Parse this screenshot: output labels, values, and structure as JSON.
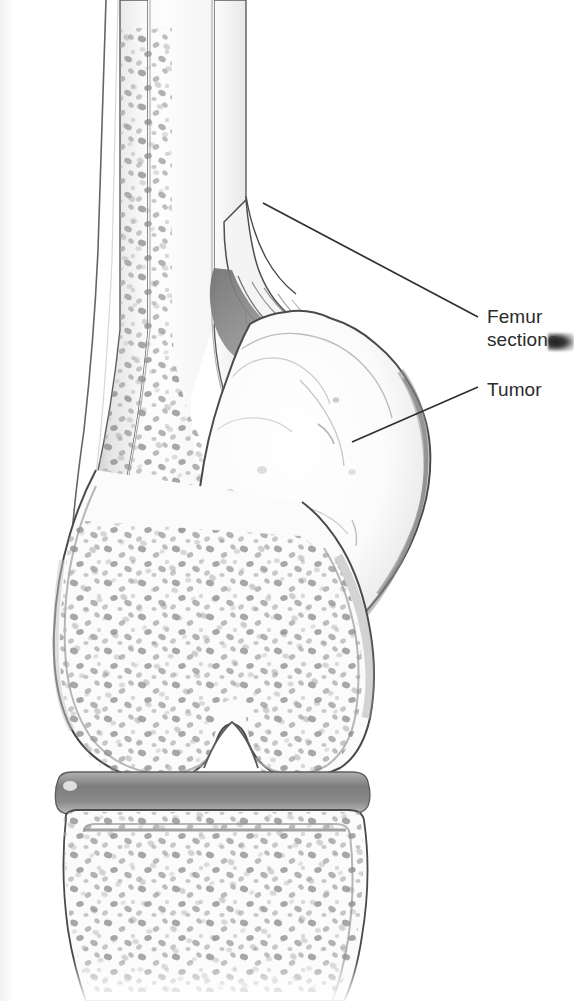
{
  "figure": {
    "style": "graphite pencil medical illustration",
    "background_color": "#ffffff",
    "ink_color": "#2b2b2b",
    "bone_fill_color": "#fbfbfb",
    "cortex_shade_color": "#cfcfcf",
    "trabecular_speckle_color": "#8d8d8d",
    "tumor_fill_color": "#fdfdfd",
    "tumor_shade_color": "#d9d9d9",
    "joint_space_color": "#8c8c8c"
  },
  "labels": [
    {
      "id": "femur-sectioned",
      "text_line1": "Femur",
      "text_line2": "sectione",
      "full_text": "Femur sectioned",
      "clipped": "true",
      "x": 487,
      "y": 305,
      "leader": {
        "x1": 263,
        "y1": 203,
        "x2": 478,
        "y2": 317
      }
    },
    {
      "id": "tumor",
      "text_line1": "Tumor",
      "full_text": "Tumor",
      "clipped": "false",
      "x": 487,
      "y": 378,
      "leader": {
        "x1": 352,
        "y1": 442,
        "x2": 478,
        "y2": 387
      }
    }
  ],
  "anatomy": {
    "parts": [
      "femoral shaft",
      "cortical bone",
      "cancellous trabecular bone",
      "periosteal elevation",
      "tumor mass",
      "medial femoral condyle",
      "lateral femoral condyle",
      "intercondylar notch",
      "knee joint space",
      "tibial plateau"
    ]
  }
}
